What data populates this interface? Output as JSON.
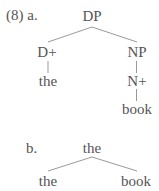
{
  "example": {
    "number": "(8)",
    "label_a": "(8) a.",
    "label_b": "b."
  },
  "colors": {
    "text": "#555555",
    "edge": "#9a9a9a",
    "background": "#ffffff"
  },
  "tree_a": {
    "root": "DP",
    "left_child": "D+",
    "left_leaf": "the",
    "right_child": "NP",
    "right_grandchild": "N+",
    "right_leaf": "book",
    "edges": [
      {
        "from": "DP",
        "to": "D+"
      },
      {
        "from": "DP",
        "to": "NP"
      },
      {
        "from": "D+",
        "to": "the"
      },
      {
        "from": "NP",
        "to": "N+"
      },
      {
        "from": "N+",
        "to": "book"
      }
    ]
  },
  "tree_b": {
    "root": "the",
    "left_child": "the",
    "right_child": "book",
    "edges": [
      {
        "from": "the",
        "to": "the"
      },
      {
        "from": "the",
        "to": "book"
      }
    ]
  }
}
